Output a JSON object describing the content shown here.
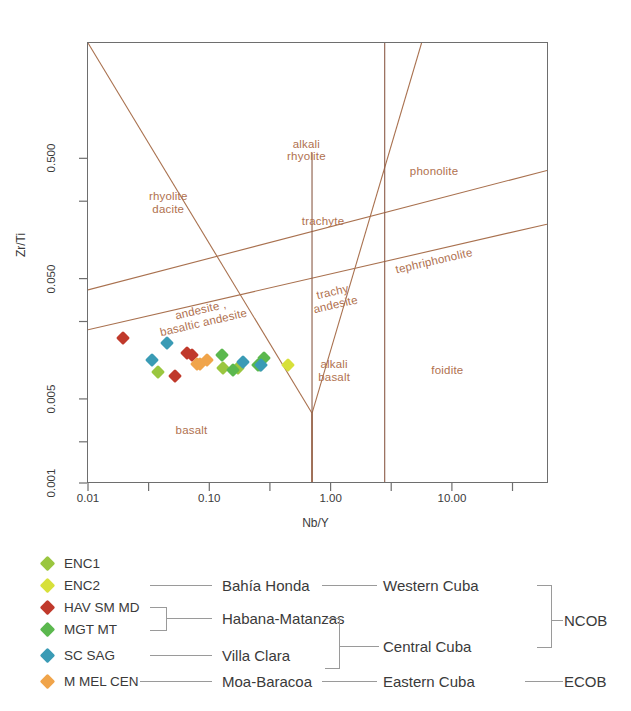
{
  "chart_data": {
    "type": "scatter",
    "title": "",
    "xlabel": "Nb/Y",
    "ylabel": "Zr/Ti",
    "xscale": "log",
    "yscale": "log",
    "xlim": [
      0.01,
      50
    ],
    "ylim": [
      0.0008,
      1.3
    ],
    "xticks": [
      "0.01",
      "0.10",
      "1.00",
      "10.00"
    ],
    "xtick_values": [
      0.01,
      0.1,
      1.0,
      10.0
    ],
    "yticks": [
      "0.001",
      "0.005",
      "0.050",
      "0.500"
    ],
    "ytick_values": [
      0.001,
      0.005,
      0.05,
      0.5
    ],
    "grid": false,
    "legend_position": "below",
    "fields": [
      {
        "name": "rhyolite\ndacite",
        "x": 0.045,
        "y": 0.22
      },
      {
        "name": "alkali\nrhyolite",
        "x": 0.62,
        "y": 0.6
      },
      {
        "name": "trachyte",
        "x": 0.85,
        "y": 0.155
      },
      {
        "name": "phonolite",
        "x": 7.0,
        "y": 0.4
      },
      {
        "name": "tephriphonolite",
        "x": 7.0,
        "y": 0.072
      },
      {
        "name": "trachy\nandesite",
        "x": 1.05,
        "y": 0.035
      },
      {
        "name": "andesite ,\nbasaltic andesite",
        "x": 0.085,
        "y": 0.025
      },
      {
        "name": "alkali\nbasalt",
        "x": 1.05,
        "y": 0.0088
      },
      {
        "name": "foidite",
        "x": 9.0,
        "y": 0.0088
      },
      {
        "name": "basalt",
        "x": 0.07,
        "y": 0.0028
      }
    ],
    "series": [
      {
        "name": "ENC1",
        "color": "#9ac63f",
        "points": [
          [
            0.037,
            0.0085
          ],
          [
            0.128,
            0.0092
          ],
          [
            0.17,
            0.0092
          ]
        ]
      },
      {
        "name": "ENC2",
        "color": "#d7e03a",
        "points": [
          [
            0.44,
            0.0098
          ]
        ]
      },
      {
        "name": "HAV SM MD",
        "color": "#c0392b",
        "points": [
          [
            0.019,
            0.0165
          ],
          [
            0.051,
            0.0079
          ],
          [
            0.064,
            0.0122
          ],
          [
            0.07,
            0.0117
          ]
        ]
      },
      {
        "name": "MGT MT",
        "color": "#5bb84e",
        "points": [
          [
            0.125,
            0.0117
          ],
          [
            0.155,
            0.0088
          ],
          [
            0.245,
            0.0098
          ],
          [
            0.255,
            0.0098
          ],
          [
            0.275,
            0.0112
          ]
        ]
      },
      {
        "name": "SC SAG",
        "color": "#3a9bb5",
        "points": [
          [
            0.033,
            0.0107
          ],
          [
            0.044,
            0.015
          ],
          [
            0.185,
            0.0103
          ],
          [
            0.26,
            0.0098
          ]
        ]
      },
      {
        "name": "M MEL CEN",
        "color": "#f0a44a",
        "points": [
          [
            0.077,
            0.01
          ],
          [
            0.082,
            0.01
          ],
          [
            0.094,
            0.0107
          ]
        ]
      }
    ]
  },
  "legend": {
    "entries": [
      {
        "key": "ENC1",
        "color": "#9ac63f"
      },
      {
        "key": "ENC2",
        "color": "#d7e03a"
      },
      {
        "key": "HAV SM MD",
        "color": "#c0392b"
      },
      {
        "key": "MGT MT",
        "color": "#5bb84e"
      },
      {
        "key": "SC SAG",
        "color": "#3a9bb5"
      },
      {
        "key": "M MEL CEN",
        "color": "#f0a44a"
      }
    ],
    "groups_level1": [
      {
        "label": "Bahía Honda"
      },
      {
        "label": "Habana-Matanzas"
      },
      {
        "label": "Villa Clara"
      },
      {
        "label": "Moa-Baracoa"
      }
    ],
    "groups_level2": [
      {
        "label": "Western Cuba"
      },
      {
        "label": "Central Cuba"
      },
      {
        "label": "Eastern Cuba"
      }
    ],
    "groups_level3": [
      {
        "label": "NCOB"
      },
      {
        "label": "ECOB"
      }
    ]
  }
}
